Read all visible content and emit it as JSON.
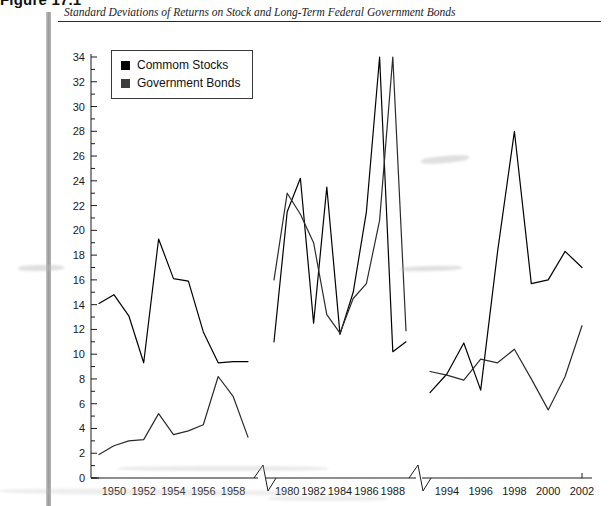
{
  "figure": {
    "number_label": "Figure 17.1",
    "caption": "Standard Deviations of Returns on Stock and Long-Term Federal Government Bonds"
  },
  "legend": {
    "position": "top-left-inside",
    "entries": [
      {
        "label": "Commom Stocks",
        "color": "#000000",
        "marker": "filled-square"
      },
      {
        "label": "Government Bonds",
        "color": "#3d3d3d",
        "marker": "filled-square"
      }
    ]
  },
  "axes": {
    "x_title": "Year",
    "y_title": "",
    "y_min": 0,
    "y_max": 34,
    "y_tick_step": 2,
    "y_minor_tick_step": 1,
    "y_ticks": [
      0,
      2,
      4,
      6,
      8,
      10,
      12,
      14,
      16,
      18,
      20,
      22,
      24,
      26,
      28,
      30,
      32,
      34
    ],
    "x_break_marker": "zigzag",
    "x_segments": [
      {
        "label_ticks": [
          1950,
          1952,
          1954,
          1956,
          1958
        ],
        "range": [
          1949,
          1959
        ]
      },
      {
        "label_ticks": [
          1980,
          1982,
          1984,
          1986,
          1988
        ],
        "range": [
          1979,
          1989
        ]
      },
      {
        "label_ticks": [
          1994,
          1996,
          1998,
          2000,
          2002
        ],
        "range": [
          1993,
          2002
        ]
      }
    ]
  },
  "chart_data": {
    "type": "line",
    "title": "Standard Deviations of Returns on Stock and Long-Term Federal Government Bonds",
    "xlabel": "Year",
    "ylabel": "",
    "ylim": [
      0,
      34
    ],
    "grid": false,
    "legend_position": "upper-left",
    "axis_break": true,
    "x_segments": [
      [
        1949,
        1959
      ],
      [
        1979,
        1989
      ],
      [
        1993,
        2002
      ]
    ],
    "series": [
      {
        "name": "Commom Stocks",
        "color": "#000000",
        "points": [
          {
            "x": 1949,
            "y": 14.1
          },
          {
            "x": 1950,
            "y": 14.8
          },
          {
            "x": 1951,
            "y": 13.1
          },
          {
            "x": 1952,
            "y": 9.3
          },
          {
            "x": 1953,
            "y": 19.3
          },
          {
            "x": 1954,
            "y": 16.1
          },
          {
            "x": 1955,
            "y": 15.9
          },
          {
            "x": 1956,
            "y": 11.8
          },
          {
            "x": 1957,
            "y": 9.3
          },
          {
            "x": 1958,
            "y": 9.4
          },
          {
            "x": 1959,
            "y": 9.4
          },
          {
            "x": 1979,
            "y": 11.0
          },
          {
            "x": 1980,
            "y": 21.5
          },
          {
            "x": 1981,
            "y": 24.2
          },
          {
            "x": 1982,
            "y": 12.5
          },
          {
            "x": 1983,
            "y": 23.5
          },
          {
            "x": 1984,
            "y": 11.6
          },
          {
            "x": 1985,
            "y": 15.0
          },
          {
            "x": 1986,
            "y": 21.5
          },
          {
            "x": 1987,
            "y": 34.0
          },
          {
            "x": 1988,
            "y": 10.2
          },
          {
            "x": 1989,
            "y": 11.0
          },
          {
            "x": 1993,
            "y": 6.9
          },
          {
            "x": 1994,
            "y": 8.4
          },
          {
            "x": 1995,
            "y": 10.9
          },
          {
            "x": 1996,
            "y": 7.1
          },
          {
            "x": 1997,
            "y": 18.3
          },
          {
            "x": 1998,
            "y": 28.0
          },
          {
            "x": 1999,
            "y": 15.7
          },
          {
            "x": 2000,
            "y": 16.0
          },
          {
            "x": 2001,
            "y": 18.3
          },
          {
            "x": 2002,
            "y": 17.0
          }
        ]
      },
      {
        "name": "Government Bonds",
        "color": "#2b2b2b",
        "points": [
          {
            "x": 1949,
            "y": 1.9
          },
          {
            "x": 1950,
            "y": 2.6
          },
          {
            "x": 1951,
            "y": 3.0
          },
          {
            "x": 1952,
            "y": 3.1
          },
          {
            "x": 1953,
            "y": 5.2
          },
          {
            "x": 1954,
            "y": 3.5
          },
          {
            "x": 1955,
            "y": 3.8
          },
          {
            "x": 1956,
            "y": 4.3
          },
          {
            "x": 1957,
            "y": 8.2
          },
          {
            "x": 1958,
            "y": 6.6
          },
          {
            "x": 1959,
            "y": 3.3
          },
          {
            "x": 1979,
            "y": 16.0
          },
          {
            "x": 1980,
            "y": 23.0
          },
          {
            "x": 1981,
            "y": 21.3
          },
          {
            "x": 1982,
            "y": 19.0
          },
          {
            "x": 1983,
            "y": 13.2
          },
          {
            "x": 1984,
            "y": 11.7
          },
          {
            "x": 1985,
            "y": 14.5
          },
          {
            "x": 1986,
            "y": 15.7
          },
          {
            "x": 1987,
            "y": 20.8
          },
          {
            "x": 1988,
            "y": 34.0
          },
          {
            "x": 1989,
            "y": 11.9
          },
          {
            "x": 1993,
            "y": 8.6
          },
          {
            "x": 1994,
            "y": 8.3
          },
          {
            "x": 1995,
            "y": 7.9
          },
          {
            "x": 1996,
            "y": 9.6
          },
          {
            "x": 1997,
            "y": 9.3
          },
          {
            "x": 1998,
            "y": 10.4
          },
          {
            "x": 1999,
            "y": 8.0
          },
          {
            "x": 2000,
            "y": 5.5
          },
          {
            "x": 2001,
            "y": 8.2
          },
          {
            "x": 2002,
            "y": 12.3
          }
        ]
      }
    ]
  }
}
